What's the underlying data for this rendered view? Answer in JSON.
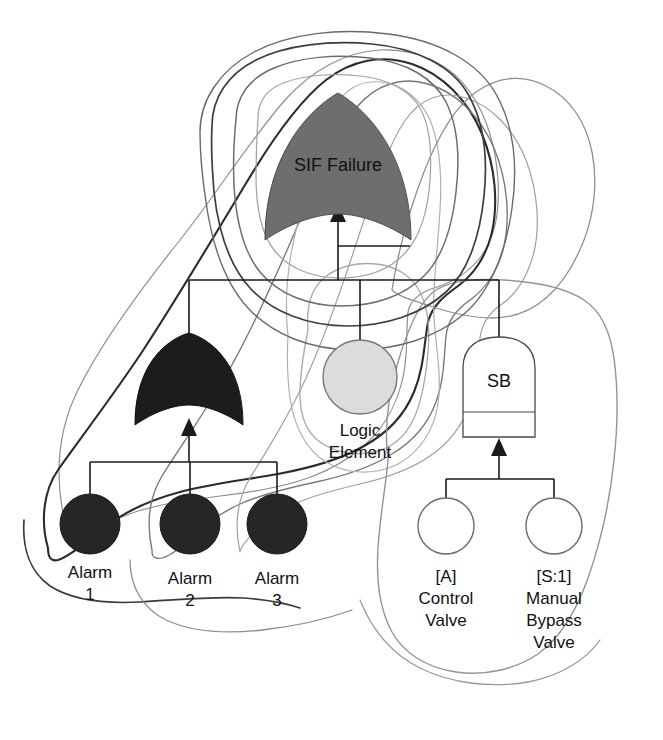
{
  "diagram": {
    "type": "fault-tree",
    "background_color": "#ffffff"
  },
  "colors": {
    "top_gate_fill": "#6e6e6e",
    "mid_gate_fill": "#1c1c1c",
    "basic_event_filled": "#262626",
    "logic_element_fill": "#dcdcdc",
    "valve_fill": "#ffffff",
    "line": "#1a1a1a",
    "loop_dark": "#333333",
    "loop_mid": "#6b6b6b",
    "loop_light": "#9a9a9a"
  },
  "nodes": {
    "top_gate": {
      "id": "sif-failure",
      "label": "SIF Failure",
      "gate_type": "AND",
      "fill": "#6e6e6e",
      "cx": 338,
      "cy": 168,
      "width": 146,
      "height": 148
    },
    "mid_gate": {
      "id": "alarm-and-gate",
      "label": "",
      "gate_type": "AND",
      "fill": "#1c1c1c",
      "cx": 189,
      "cy": 379,
      "width": 110,
      "height": 93
    },
    "sb_gate": {
      "id": "sb-gate",
      "label": "SB",
      "gate_type": "OR",
      "fill": "#ffffff",
      "cx": 499,
      "cy": 387,
      "width": 74,
      "height": 100
    },
    "logic_element": {
      "id": "logic-element",
      "label_line1": "Logic",
      "label_line2": "Element",
      "fill": "#dcdcdc",
      "cx": 360,
      "cy": 377,
      "r": 37
    },
    "basic_events": [
      {
        "id": "alarm-1",
        "label_line1": "Alarm",
        "label_line2": "1",
        "fill": "#262626",
        "cx": 90,
        "cy": 524,
        "r": 30
      },
      {
        "id": "alarm-2",
        "label_line1": "Alarm",
        "label_line2": "2",
        "fill": "#262626",
        "cx": 190,
        "cy": 524,
        "r": 30
      },
      {
        "id": "alarm-3",
        "label_line1": "Alarm",
        "label_line2": "3",
        "fill": "#262626",
        "cx": 277,
        "cy": 524,
        "r": 30
      },
      {
        "id": "control-valve",
        "label_line1": "[A]",
        "label_line2": "Control",
        "label_line3": "Valve",
        "fill": "#ffffff",
        "cx": 446,
        "cy": 526,
        "r": 28
      },
      {
        "id": "manual-bypass-valve",
        "label_line1": "[S:1]",
        "label_line2": "Manual",
        "label_line3": "Bypass",
        "label_line4": "Valve",
        "fill": "#ffffff",
        "cx": 554,
        "cy": 526,
        "r": 28
      }
    ]
  },
  "connections": [
    {
      "from": "mid_gate",
      "to": "top_gate",
      "kind": "bus"
    },
    {
      "from": "logic_element",
      "to": "top_gate",
      "kind": "bus"
    },
    {
      "from": "sb_gate",
      "to": "top_gate",
      "kind": "bus"
    },
    {
      "from": "alarm-1",
      "to": "mid_gate",
      "kind": "bus"
    },
    {
      "from": "alarm-2",
      "to": "mid_gate",
      "kind": "bus"
    },
    {
      "from": "alarm-3",
      "to": "mid_gate",
      "kind": "bus"
    },
    {
      "from": "control-valve",
      "to": "sb_gate",
      "kind": "bus"
    },
    {
      "from": "manual-bypass-valve",
      "to": "sb_gate",
      "kind": "bus"
    }
  ],
  "cut_set_loops": [
    {
      "id": "loop-outer-left",
      "stroke": "#8a8a8a",
      "width": 1.2
    },
    {
      "id": "loop-alarm1-sif",
      "stroke": "#2b2b2b",
      "width": 2.0
    },
    {
      "id": "loop-alarm2-sif",
      "stroke": "#777777",
      "width": 1.3
    },
    {
      "id": "loop-alarm3-sif",
      "stroke": "#9b9b9b",
      "width": 1.2
    },
    {
      "id": "loop-logic-element",
      "stroke": "#a5a5a5",
      "width": 1.2
    },
    {
      "id": "loop-sb-subtree",
      "stroke": "#949494",
      "width": 1.3
    },
    {
      "id": "loop-top-inner",
      "stroke": "#9f9f9f",
      "width": 1.2
    },
    {
      "id": "loop-top-mid",
      "stroke": "#6d6d6d",
      "width": 1.4
    },
    {
      "id": "loop-top-outer",
      "stroke": "#3a3a3a",
      "width": 1.6
    }
  ]
}
